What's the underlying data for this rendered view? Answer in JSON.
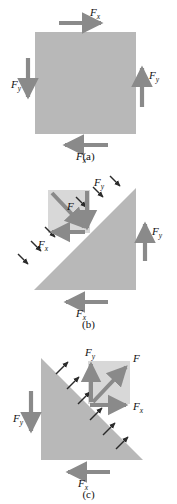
{
  "figure": {
    "colors": {
      "shape_fill": "#b8b8b8",
      "inset_fill": "#d8d8d8",
      "arrow": "#8a8a8a",
      "small_arrow": "#2b2b2b",
      "text": "#111111",
      "background": "#ffffff"
    }
  },
  "panels": [
    {
      "id": "a",
      "caption": "(a)",
      "shape": "square",
      "labels": {
        "top": "F",
        "top_sub": "x",
        "right": "F",
        "right_sub": "y",
        "left": "F",
        "left_sub": "y",
        "bottom": "F",
        "bottom_sub": "x"
      },
      "arrows": [
        {
          "name": "top-force-arrow",
          "direction": "right",
          "label": "Fx"
        },
        {
          "name": "right-force-arrow",
          "direction": "up",
          "label": "Fy"
        },
        {
          "name": "left-force-arrow",
          "direction": "down",
          "label": "Fy"
        },
        {
          "name": "bottom-force-arrow",
          "direction": "left",
          "label": "Fx"
        }
      ]
    },
    {
      "id": "b",
      "caption": "(b)",
      "shape": "triangle-right-angle-bottom-right",
      "labels": {
        "resultant": "F",
        "inset_y": "F",
        "inset_y_sub": "y",
        "inset_x": "F",
        "inset_x_sub": "x",
        "right": "F",
        "right_sub": "y",
        "bottom": "F",
        "bottom_sub": "x"
      },
      "arrows": [
        {
          "name": "resultant-force-arrow",
          "direction": "down-right",
          "label": "F"
        },
        {
          "name": "inset-fy-arrow",
          "direction": "down",
          "label": "Fy"
        },
        {
          "name": "inset-fx-arrow",
          "direction": "left",
          "label": "Fx"
        },
        {
          "name": "right-force-arrow",
          "direction": "up",
          "label": "Fy"
        },
        {
          "name": "bottom-force-arrow",
          "direction": "left",
          "label": "Fx"
        }
      ],
      "traction_arrows_direction": "into-hypotenuse-down-right",
      "traction_arrow_count": 6
    },
    {
      "id": "c",
      "caption": "(c)",
      "shape": "triangle-right-angle-bottom-left",
      "labels": {
        "resultant": "F",
        "inset_y": "F",
        "inset_y_sub": "y",
        "inset_x": "F",
        "inset_x_sub": "x",
        "left": "F",
        "left_sub": "y",
        "bottom": "F",
        "bottom_sub": "x"
      },
      "arrows": [
        {
          "name": "resultant-force-arrow",
          "direction": "up-right",
          "label": "F"
        },
        {
          "name": "inset-fy-arrow",
          "direction": "up",
          "label": "Fy"
        },
        {
          "name": "inset-fx-arrow",
          "direction": "right",
          "label": "Fx"
        },
        {
          "name": "left-force-arrow",
          "direction": "down",
          "label": "Fy"
        },
        {
          "name": "bottom-force-arrow",
          "direction": "left",
          "label": "Fx"
        }
      ],
      "traction_arrows_direction": "out-of-hypotenuse-up-right",
      "traction_arrow_count": 6
    }
  ]
}
